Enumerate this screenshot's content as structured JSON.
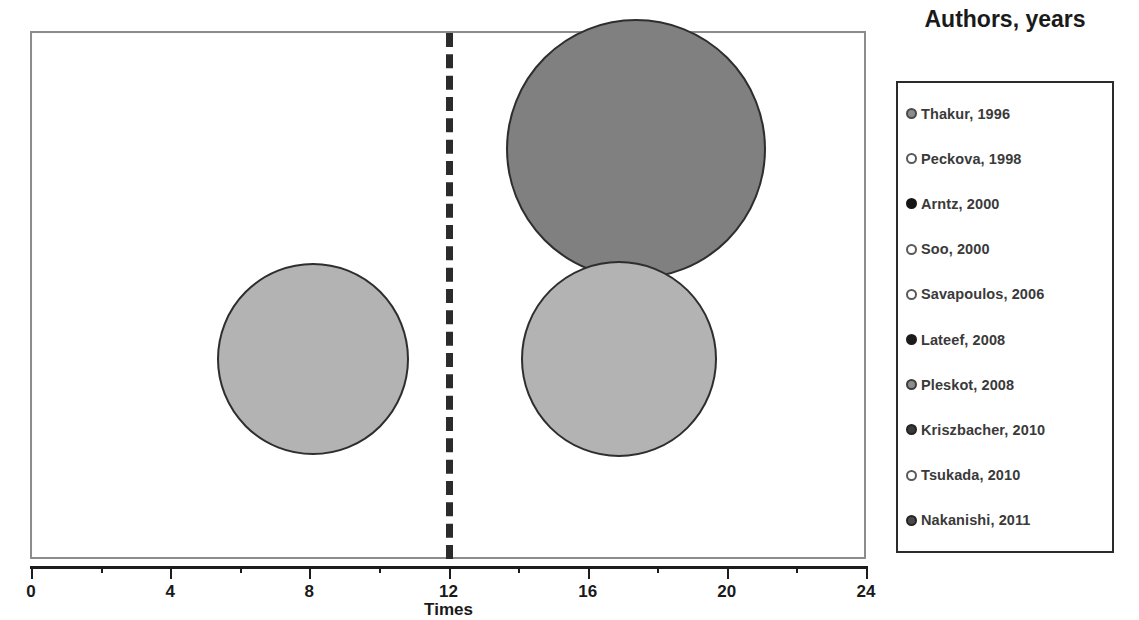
{
  "chart_data": {
    "type": "scatter",
    "title": "Sudden cardiac death or cardiac arrest in women",
    "xlabel": "Times",
    "ylabel": "",
    "xlim": [
      0,
      24
    ],
    "xticks": [
      0,
      4,
      8,
      12,
      16,
      20,
      24
    ],
    "xtick_labels": [
      "0",
      "4",
      "8",
      "12",
      "16",
      "20",
      "24"
    ],
    "minor_ticks": [
      2,
      6,
      10,
      14,
      18,
      22
    ],
    "grid": false,
    "legend_position": "right",
    "reference_line": {
      "orientation": "vertical",
      "x": 12,
      "style": "dashed",
      "color": "#2b2b2b"
    },
    "bubbles": [
      {
        "label": "bubble-left",
        "x": 8.1,
        "y": 0.38,
        "radius_px": 96,
        "fill": "#b3b3b3",
        "stroke": "#2e2e2e"
      },
      {
        "label": "bubble-top-right",
        "x": 17.4,
        "y": 0.78,
        "radius_px": 130,
        "fill": "#808080",
        "stroke": "#2e2e2e"
      },
      {
        "label": "bubble-bottom-right",
        "x": 16.9,
        "y": 0.38,
        "radius_px": 98,
        "fill": "#b3b3b3",
        "stroke": "#2e2e2e"
      }
    ],
    "legend_entries": [
      {
        "label": "Thakur, 1996",
        "fill": "#8c8c8c",
        "stroke": "#4a4a4a",
        "style": "filled-gray"
      },
      {
        "label": "Peckova, 1998",
        "fill": "#ffffff",
        "stroke": "#5a5a5a",
        "style": "hollow"
      },
      {
        "label": "Arntz, 2000",
        "fill": "#151515",
        "stroke": "#151515",
        "style": "filled-black"
      },
      {
        "label": "Soo, 2000",
        "fill": "#ffffff",
        "stroke": "#5a5a5a",
        "style": "hollow"
      },
      {
        "label": "Savapoulos, 2006",
        "fill": "#ffffff",
        "stroke": "#5a5a5a",
        "style": "hollow"
      },
      {
        "label": "Lateef, 2008",
        "fill": "#1c1c1c",
        "stroke": "#1c1c1c",
        "style": "filled-black"
      },
      {
        "label": "Pleskot, 2008",
        "fill": "#8c8c8c",
        "stroke": "#3d3d3d",
        "style": "filled-gray"
      },
      {
        "label": "Kriszbacher, 2010",
        "fill": "#3a3a3a",
        "stroke": "#222222",
        "style": "filled-dark"
      },
      {
        "label": "Tsukada, 2010",
        "fill": "#ffffff",
        "stroke": "#5a5a5a",
        "style": "hollow"
      },
      {
        "label": "Nakanishi, 2011",
        "fill": "#4a4a4a",
        "stroke": "#242424",
        "style": "filled-dark"
      }
    ]
  },
  "legend": {
    "title": "Authors, years"
  },
  "axis": {
    "x_title": "Times"
  }
}
